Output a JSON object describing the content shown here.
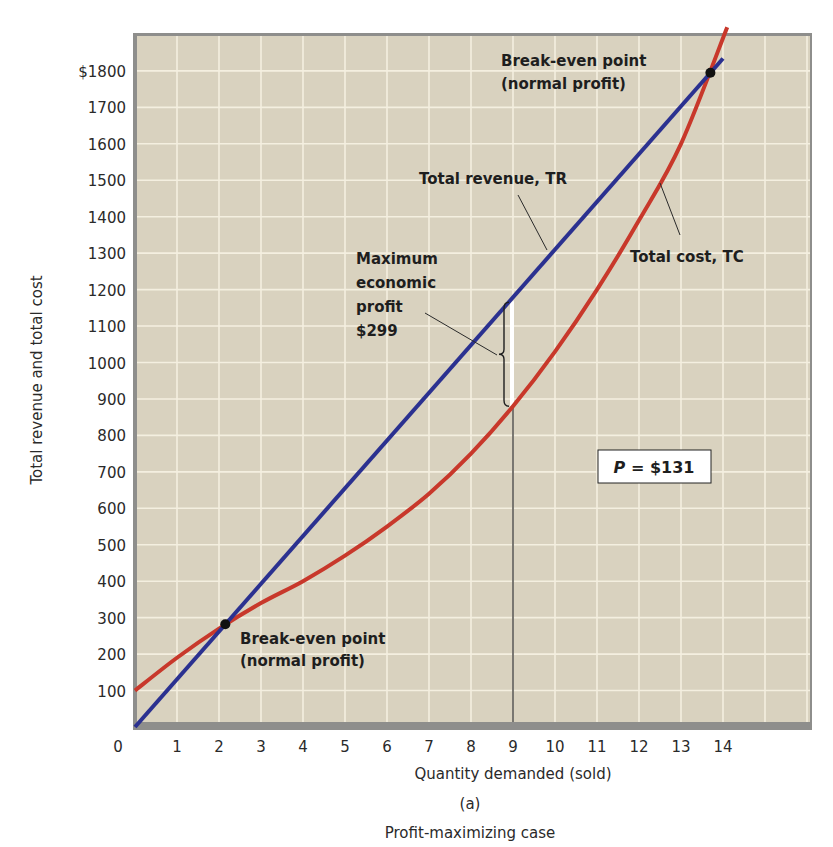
{
  "chart_data": {
    "type": "line",
    "title": "",
    "caption_letter": "(a)",
    "caption": "Profit-maximizing case",
    "xlabel": "Quantity demanded (sold)",
    "ylabel": "Total revenue and total cost",
    "xlim": [
      0,
      15
    ],
    "ylim": [
      0,
      1900
    ],
    "grid": true,
    "x_ticks": [
      "0",
      "1",
      "2",
      "3",
      "4",
      "5",
      "6",
      "7",
      "8",
      "9",
      "10",
      "11",
      "12",
      "13",
      "14"
    ],
    "y_ticks": [
      "100",
      "200",
      "300",
      "400",
      "500",
      "600",
      "700",
      "800",
      "900",
      "1000",
      "1100",
      "1200",
      "1300",
      "1400",
      "1500",
      "1600",
      "1700",
      "$1800"
    ],
    "x": [
      0,
      1,
      2,
      3,
      4,
      5,
      6,
      7,
      8,
      9,
      10,
      11,
      12,
      13,
      14
    ],
    "series": [
      {
        "name": "Total revenue, TR",
        "color": "#2b3190",
        "values": [
          0,
          131,
          262,
          393,
          524,
          655,
          786,
          917,
          1048,
          1179,
          1310,
          1441,
          1572,
          1703,
          1834
        ]
      },
      {
        "name": "Total cost, TC",
        "color": "#c8382b",
        "values": [
          100,
          190,
          270,
          340,
          400,
          470,
          550,
          640,
          750,
          880,
          1030,
          1200,
          1390,
          1600,
          1880
        ]
      }
    ],
    "annotations": {
      "break_even_low": {
        "line1": "Break-even point",
        "line2": "(normal profit)",
        "q": 2.15,
        "value": 282
      },
      "break_even_high": {
        "line1": "Break-even point",
        "line2": "(normal profit)",
        "q": 13.7,
        "value": 1795
      },
      "tr_label": "Total revenue, TR",
      "tc_label": "Total cost, TC",
      "max_profit": {
        "line1": "Maximum",
        "line2": "economic",
        "line3": "profit",
        "line4": "$299",
        "q": 9,
        "tr": 1179,
        "tc": 880
      },
      "price_box": {
        "label": "P",
        "equals": " = $131"
      }
    },
    "legend_position": "none (inline labels)"
  },
  "colors": {
    "plot_bg": "#d9d2bf",
    "grid": "#f4efe0",
    "frame": "#8e8e8c",
    "tr": "#2b3190",
    "tc": "#c8382b"
  }
}
